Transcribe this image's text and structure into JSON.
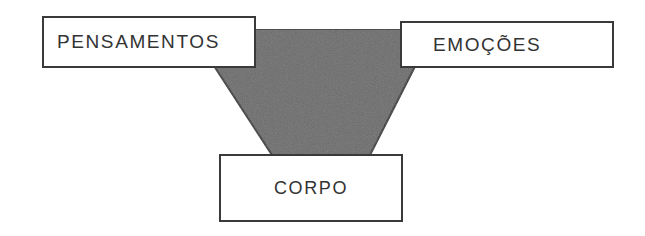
{
  "diagram": {
    "background_color": "#ffffff",
    "shape": {
      "name": "inverted-trapezoid",
      "fill_color": "#6d6d6d",
      "stroke_color": "#3a3a3a",
      "top_width_px": 244,
      "bottom_width_px": 98,
      "top_y_px": 29,
      "bottom_y_px": 155
    },
    "nodes": [
      {
        "id": "pensamentos",
        "label": "PENSAMENTOS",
        "position": "top-left",
        "text_color": "#333333",
        "border_color": "#3a3a3a",
        "fill_color": "#ffffff"
      },
      {
        "id": "emocoes",
        "label": "EMOÇÕES",
        "position": "top-right",
        "text_color": "#333333",
        "border_color": "#3a3a3a",
        "fill_color": "#ffffff"
      },
      {
        "id": "corpo",
        "label": "CORPO",
        "position": "bottom-center",
        "text_color": "#333333",
        "border_color": "#3a3a3a",
        "fill_color": "#ffffff"
      }
    ]
  }
}
